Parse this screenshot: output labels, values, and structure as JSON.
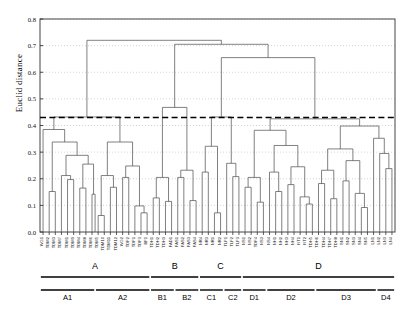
{
  "axis": {
    "ylabel": "Euclid distance",
    "yticks": [
      "0.0",
      "0.1",
      "0.2",
      "0.3",
      "0.4",
      "0.5",
      "0.6",
      "0.7",
      "0.8"
    ],
    "ymin": 0.0,
    "ymax": 0.8,
    "tickstep": 0.1,
    "grid": true,
    "gridstyle": "dotted"
  },
  "threshold": {
    "value": 0.43,
    "style": "dashed",
    "label": ""
  },
  "groups": {
    "major": [
      {
        "label": "A",
        "start": 0,
        "end": 17
      },
      {
        "label": "B",
        "start": 18,
        "end": 25
      },
      {
        "label": "C",
        "start": 26,
        "end": 32
      },
      {
        "label": "D",
        "start": 33,
        "end": 57
      }
    ],
    "minor": [
      {
        "label": "A1",
        "start": 0,
        "end": 8
      },
      {
        "label": "A2",
        "start": 9,
        "end": 17
      },
      {
        "label": "B1",
        "start": 18,
        "end": 21
      },
      {
        "label": "B2",
        "start": 22,
        "end": 25
      },
      {
        "label": "C1",
        "start": 26,
        "end": 29
      },
      {
        "label": "C2",
        "start": 30,
        "end": 32
      },
      {
        "label": "D1",
        "start": 33,
        "end": 36
      },
      {
        "label": "D2",
        "start": 37,
        "end": 44
      },
      {
        "label": "D3",
        "start": 45,
        "end": 54
      },
      {
        "label": "D4",
        "start": 55,
        "end": 57
      }
    ]
  },
  "chart_data": {
    "type": "dendrogram",
    "title": "",
    "xlabel": "",
    "ylabel": "Euclid distance",
    "ylim": [
      0.0,
      0.8
    ],
    "leaf_count": 58,
    "leaf_labels": [
      "WG1",
      "TDM2",
      "TDM3",
      "TDM7",
      "TDM1",
      "TDM9",
      "TDM4",
      "TDM8",
      "TDM6",
      "TDM5",
      "TDM10",
      "TDM11",
      "TDM12",
      "WG2",
      "TDF2",
      "TDF1",
      "TDF3",
      "BF1",
      "TDH1",
      "TDH2",
      "TDH3",
      "FAD1",
      "FAS1",
      "FAS2",
      "FAS3",
      "FAS4",
      "NR4",
      "NR3",
      "NR1",
      "NR2",
      "TLF1",
      "TLF2",
      "TLF3",
      "NS1",
      "NS2",
      "TDF4",
      "NS3",
      "NS4",
      "NH1",
      "NH2",
      "NH3",
      "NH4",
      "NT1",
      "NT2",
      "TDH5",
      "TDH6",
      "TDH4",
      "TDH7",
      "TDH8",
      "SN1",
      "SN2",
      "SN3",
      "SN4",
      "SN5",
      "LN1",
      "LN2",
      "LN3",
      "LN4"
    ],
    "merges": [
      {
        "note": "root",
        "height": 0.72,
        "left_x": 92,
        "right_x": 220
      },
      {
        "note": "right-subroot",
        "height": 0.705,
        "left_x": 166,
        "right_x": 275
      },
      {
        "note": "CD-join",
        "height": 0.655,
        "left_x": 231,
        "right_x": 318
      },
      {
        "note": "A-stem",
        "height": 0.432,
        "left_x": 49,
        "right_x": 135
      },
      {
        "note": "B-stem",
        "height": 0.468,
        "left_x": 155,
        "right_x": 178
      },
      {
        "note": "C-stem",
        "height": 0.432,
        "left_x": 218,
        "right_x": 245
      },
      {
        "note": "D-stem",
        "height": 0.425,
        "left_x": 287,
        "right_x": 350
      }
    ]
  }
}
